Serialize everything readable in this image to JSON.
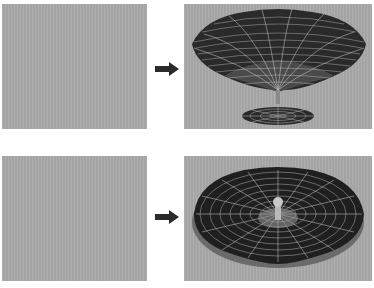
{
  "figure": {
    "rows": [
      {
        "before": {
          "label": "empty-viewport",
          "fill": "#a9a9a9"
        },
        "arrow": {
          "icon": "right-arrow-icon",
          "color": "#2b2b2b"
        },
        "after": {
          "label": "funnel-wireframe-with-disc",
          "fill": "#a9a9a9",
          "mesh_color": "#2a2a2a",
          "grid_color": "#d8d8d8"
        }
      },
      {
        "before": {
          "label": "empty-viewport",
          "fill": "#a9a9a9"
        },
        "arrow": {
          "icon": "right-arrow-icon",
          "color": "#2b2b2b"
        },
        "after": {
          "label": "bowl-wireframe-with-center-knob",
          "fill": "#a9a9a9",
          "mesh_color": "#1f1f1f",
          "grid_color": "#d8d8d8"
        }
      }
    ]
  }
}
